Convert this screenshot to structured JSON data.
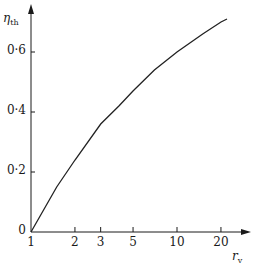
{
  "chart_data": {
    "type": "line",
    "title": "",
    "xlabel": "r_v",
    "xlabel_main": "r",
    "xlabel_sub": "v",
    "ylabel": "η_th",
    "ylabel_main": "η",
    "ylabel_sub": "th",
    "x_scale": "log",
    "xlim": [
      1,
      25
    ],
    "ylim": [
      0,
      0.75
    ],
    "grid": false,
    "legend": null,
    "x_ticks": [
      1,
      2,
      3,
      5,
      10,
      20
    ],
    "x_tick_labels": [
      "1",
      "2",
      "3",
      "5",
      "10",
      "20"
    ],
    "y_ticks": [
      0,
      0.2,
      0.4,
      0.6
    ],
    "y_tick_labels": [
      "0",
      "0·2",
      "0·4",
      "0·6"
    ],
    "series": [
      {
        "name": "thermal efficiency",
        "x": [
          1,
          1.5,
          2,
          3,
          4,
          5,
          7,
          10,
          15,
          20,
          22
        ],
        "y": [
          0,
          0.15,
          0.24,
          0.36,
          0.42,
          0.47,
          0.54,
          0.6,
          0.66,
          0.7,
          0.71
        ]
      }
    ]
  }
}
